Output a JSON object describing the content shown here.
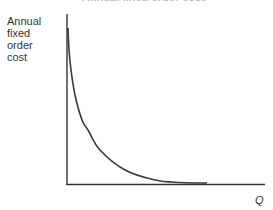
{
  "chart_data": {
    "type": "line",
    "title": "Annual fixed order cost",
    "xlabel": "Q",
    "ylabel": "Annual fixed order cost",
    "ylabel_lines": [
      "Annual",
      "fixed",
      "order",
      "cost"
    ],
    "grid": false,
    "legend": null,
    "ticks": {
      "x": [],
      "y": []
    },
    "series": [
      {
        "name": "Annual fixed order cost",
        "description": "Hyperbolic decreasing curve (cost ∝ 1/Q)",
        "color": "#3a3a3a",
        "points_px": [
          [
            68,
            28
          ],
          [
            69,
            50
          ],
          [
            71,
            70
          ],
          [
            75,
            95
          ],
          [
            82,
            120
          ],
          [
            88,
            130
          ],
          [
            100,
            150
          ],
          [
            125,
            170
          ],
          [
            155,
            180
          ],
          [
            180,
            182.5
          ],
          [
            207,
            183
          ]
        ]
      }
    ],
    "axis_color": "#333333"
  }
}
